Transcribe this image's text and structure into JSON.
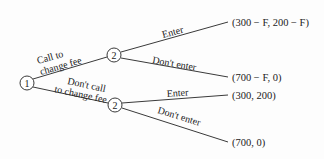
{
  "diagram": {
    "type": "game-tree",
    "nodes": [
      {
        "id": "root",
        "label": "1",
        "player": "1"
      },
      {
        "id": "upper",
        "label": "2",
        "player": "2"
      },
      {
        "id": "lower",
        "label": "2",
        "player": "2"
      }
    ],
    "edges": [
      {
        "from": "root",
        "to": "upper",
        "label_line1": "Call to",
        "label_line2": "change fee"
      },
      {
        "from": "root",
        "to": "lower",
        "label_line1": "Don't call",
        "label_line2": "to change fee"
      },
      {
        "from": "upper",
        "to": "payoff_ue",
        "label": "Enter"
      },
      {
        "from": "upper",
        "to": "payoff_ud",
        "label": "Don't enter"
      },
      {
        "from": "lower",
        "to": "payoff_le",
        "label": "Enter"
      },
      {
        "from": "lower",
        "to": "payoff_ld",
        "label": "Don't enter"
      }
    ],
    "payoffs": {
      "upper_enter": "(300 − F, 200 − F)",
      "upper_dont_enter": "(700 − F, 0)",
      "lower_enter": "(300, 200)",
      "lower_dont_enter": "(700, 0)"
    }
  }
}
